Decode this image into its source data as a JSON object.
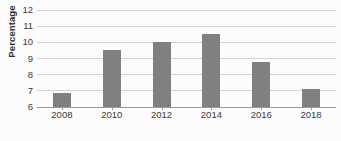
{
  "chart_data": {
    "type": "bar",
    "title": "",
    "subtitle": "",
    "xlabel": "",
    "ylabel": "Percentage",
    "categories": [
      "2008",
      "2010",
      "2012",
      "2014",
      "2016",
      "2018"
    ],
    "values": [
      6.85,
      9.55,
      10.05,
      10.5,
      8.8,
      7.1
    ],
    "series": [
      {
        "name": "Percentage",
        "values": [
          6.85,
          9.55,
          10.05,
          10.5,
          8.8,
          7.1
        ]
      }
    ],
    "ylim": [
      6,
      12
    ],
    "ytick_values": [
      6,
      7,
      8,
      9,
      10,
      11,
      12
    ],
    "ytick_labels": [
      "6",
      "7",
      "8",
      "9",
      "10",
      "11",
      "12"
    ],
    "xtick_labels": [
      "2008",
      "2010",
      "2012",
      "2014",
      "2016",
      "2018"
    ],
    "grid": true,
    "grid_axis": "y",
    "legend": false,
    "legend_position": "none",
    "bar_color": "#808080",
    "gridline_color": "#d2d2d2",
    "axis_color": "#9a9a9a",
    "text_color": "#3a3a3a",
    "background_color": "#fcfcfc",
    "annotations": []
  }
}
